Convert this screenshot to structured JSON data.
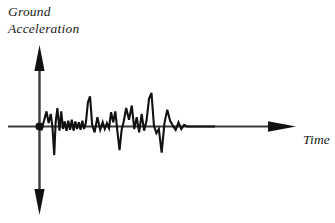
{
  "figure": {
    "title_label_line1": "Ground",
    "title_label_line2": "Acceleration",
    "time_label": "Time",
    "background_color": "#ffffff",
    "stroke_color": "#1a1a1a",
    "axis_color": "#3a3a3a"
  },
  "chart_data": {
    "type": "line",
    "title": "",
    "subtitle": "",
    "xlabel": "Time",
    "ylabel": "Ground Acceleration",
    "grid": false,
    "legend": null,
    "axis_style": "arrowed-cartesian-axes",
    "origin_marker": "filled-dot",
    "xlim": [
      0,
      100
    ],
    "ylim": [
      -100,
      100
    ],
    "xticks": [],
    "yticks": [],
    "annotations": [
      {
        "name": "y-axis-label",
        "text": "Ground Acceleration",
        "position": "top-left"
      },
      {
        "name": "x-axis-label",
        "text": "Time",
        "position": "right"
      }
    ],
    "series": [
      {
        "name": "Ground acceleration record",
        "x": [
          0,
          1.2,
          2.6,
          4.0,
          5.2,
          6.4,
          7.4,
          8.4,
          9.2,
          10.2,
          11.4,
          12.4,
          13.4,
          14.4,
          15.4,
          16.4,
          17.4,
          18.4,
          19.4,
          20.4,
          21.4,
          22.4,
          23.4,
          24.4,
          25.4,
          26.4,
          27.6,
          28.8,
          30.0,
          31.4,
          33.0,
          34.6,
          36.0,
          37.2,
          38.4,
          39.6,
          40.8,
          42.0,
          43.2,
          44.4,
          45.6,
          46.8,
          48.0,
          49.4,
          51.0,
          52.6,
          54.0,
          55.4,
          56.8,
          58.2,
          59.6,
          61.0,
          62.4,
          63.8,
          65.2,
          66.6,
          68.0,
          69.6,
          71.2,
          72.8,
          74.4,
          76.0,
          77.6,
          79.2,
          80.8,
          82.4,
          84.0,
          85.6,
          87.2,
          88.8,
          90.4,
          92.0,
          93.6,
          95.2,
          96.8,
          98.4,
          100.0
        ],
        "y": [
          0,
          -6,
          14,
          36,
          8,
          30,
          -2,
          -68,
          10,
          44,
          -10,
          36,
          -6,
          12,
          -10,
          14,
          -8,
          16,
          -10,
          12,
          -6,
          10,
          -8,
          14,
          -6,
          8,
          58,
          72,
          4,
          -14,
          22,
          -8,
          10,
          -6,
          8,
          -4,
          34,
          10,
          36,
          -12,
          -56,
          -8,
          12,
          44,
          16,
          50,
          -6,
          22,
          -14,
          30,
          -10,
          14,
          66,
          80,
          2,
          -16,
          -6,
          -62,
          8,
          40,
          14,
          2,
          -8,
          10,
          -6,
          4,
          0,
          0,
          0,
          0,
          0,
          0,
          0,
          0,
          0,
          0,
          0
        ]
      }
    ]
  }
}
